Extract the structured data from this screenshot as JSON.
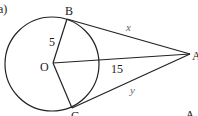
{
  "diagram": {
    "part_label": "a)",
    "points": {
      "B": "B",
      "O": "O",
      "C": "C",
      "A": "A"
    },
    "labels": {
      "OB": "5",
      "OA": "15",
      "BA": "x",
      "CA": "y"
    },
    "corner_text": "A."
  }
}
